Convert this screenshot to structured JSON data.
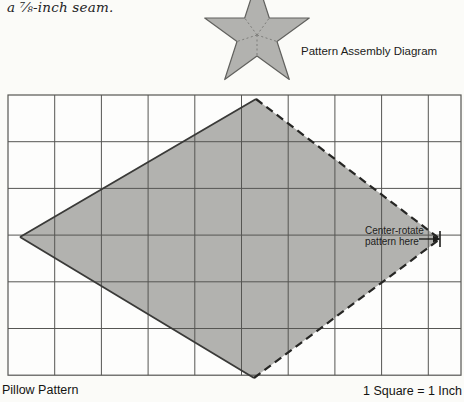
{
  "caption": {
    "text": "a ⅞-inch seam."
  },
  "assembly": {
    "label": "Pattern Assembly Diagram"
  },
  "pillow": {
    "label": "Pillow Pattern",
    "scale_label": "1 Square = 1 Inch",
    "annotation_line1": "Center-rotate",
    "annotation_line2": "pattern here"
  },
  "grid": {
    "square_unit": "1 Inch",
    "rows": 6,
    "visible_columns": 10
  },
  "colors": {
    "background": "#fbfbf8",
    "grid_background": "#fdfdfc",
    "grid_line": "#565653",
    "shape_fill": "#b2b2af",
    "shape_outline": "#61615e",
    "edge_solid": "#3a3a38",
    "edge_dashed": "#262624",
    "dotted_line": "#7d7d7a",
    "ink": "#1d1d1b"
  }
}
